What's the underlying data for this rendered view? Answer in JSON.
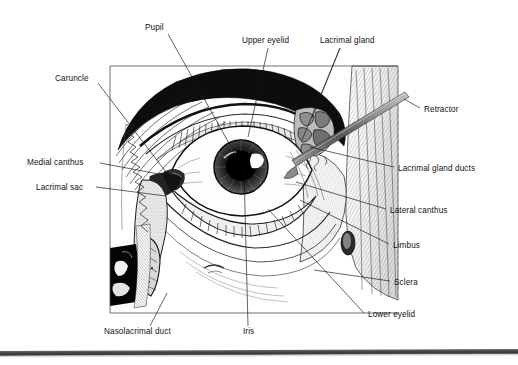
{
  "figure": {
    "type": "anatomical-illustration",
    "style": "black-and-white pen-and-ink engraving",
    "frame": {
      "left": 110,
      "top": 66,
      "right": 398,
      "bottom": 313
    },
    "background_color": "#ffffff",
    "ink_color": "#111111",
    "scan_bar_color": "#454545"
  },
  "labels": [
    {
      "id": "pupil",
      "text": "Pupil",
      "x": 145,
      "y": 28,
      "align": "left",
      "leaders": [
        [
          [
            168,
            34
          ],
          [
            240,
            163
          ]
        ]
      ]
    },
    {
      "id": "upper-eyelid",
      "text": "Upper eyelid",
      "x": 242,
      "y": 41,
      "align": "left",
      "leaders": [
        [
          [
            268,
            48
          ],
          [
            248,
            137
          ]
        ]
      ]
    },
    {
      "id": "lacrimal-gland",
      "text": "Lacrimal gland",
      "x": 320,
      "y": 41,
      "align": "left",
      "leaders": [
        [
          [
            340,
            48
          ],
          [
            312,
            118
          ]
        ],
        [
          [
            340,
            48
          ],
          [
            302,
            140
          ]
        ]
      ]
    },
    {
      "id": "caruncle",
      "text": "Caruncle",
      "x": 55,
      "y": 79,
      "align": "left",
      "leaders": [
        [
          [
            98,
            83
          ],
          [
            172,
            180
          ]
        ]
      ]
    },
    {
      "id": "retractor",
      "text": "Retractor",
      "x": 424,
      "y": 110,
      "align": "left",
      "leaders": [
        [
          [
            420,
            108
          ],
          [
            404,
            99
          ]
        ]
      ]
    },
    {
      "id": "medial-canthus",
      "text": "Medial canthus",
      "x": 27,
      "y": 163,
      "align": "left",
      "leaders": [
        [
          [
            100,
            163
          ],
          [
            180,
            178
          ]
        ]
      ]
    },
    {
      "id": "lacrimal-gland-ducts",
      "text": "Lacrimal gland ducts",
      "x": 398,
      "y": 169,
      "align": "left",
      "leaders": [
        [
          [
            394,
            167
          ],
          [
            310,
            147
          ]
        ]
      ]
    },
    {
      "id": "lacrimal-sac",
      "text": "Lacrimal sac",
      "x": 36,
      "y": 188,
      "align": "left",
      "leaders": [
        [
          [
            96,
            187
          ],
          [
            166,
            196
          ]
        ]
      ]
    },
    {
      "id": "lateral-canthus",
      "text": "Lateral canthus",
      "x": 390,
      "y": 211,
      "align": "left",
      "leaders": [
        [
          [
            386,
            209
          ],
          [
            296,
            182
          ]
        ]
      ]
    },
    {
      "id": "limbus",
      "text": "Limbus",
      "x": 393,
      "y": 246,
      "align": "left",
      "leaders": [
        [
          [
            389,
            244
          ],
          [
            300,
            200
          ]
        ]
      ]
    },
    {
      "id": "sclera",
      "text": "Sclera",
      "x": 394,
      "y": 283,
      "align": "left",
      "leaders": [
        [
          [
            390,
            281
          ],
          [
            314,
            270
          ]
        ]
      ]
    },
    {
      "id": "lower-eyelid",
      "text": "Lower eyelid",
      "x": 368,
      "y": 315,
      "align": "left",
      "leaders": [
        [
          [
            364,
            313
          ],
          [
            268,
            209
          ]
        ]
      ]
    },
    {
      "id": "nasolacrimal-duct",
      "text": "Nasolacrimal duct",
      "x": 104,
      "y": 332,
      "align": "left",
      "leaders": [
        [
          [
            150,
            326
          ],
          [
            167,
            293
          ]
        ]
      ]
    },
    {
      "id": "iris",
      "text": "Iris",
      "x": 243,
      "y": 332,
      "align": "left",
      "leaders": [
        [
          [
            248,
            326
          ],
          [
            244,
            170
          ]
        ]
      ]
    }
  ]
}
